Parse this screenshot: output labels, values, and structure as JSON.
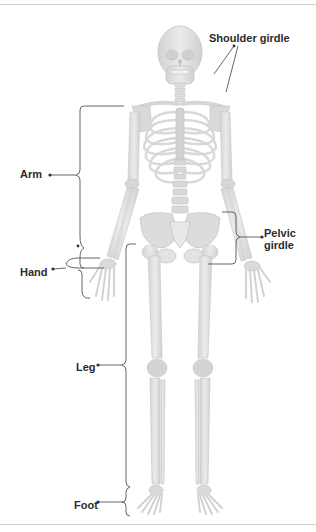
{
  "figure": {
    "top_caption_cut": "...pp...",
    "bottom_caption_cut": "..."
  },
  "labels": {
    "shoulder_girdle": "Shoulder girdle",
    "arm": "Arm",
    "hand": "Hand",
    "pelvic_girdle_line1": "Pelvic",
    "pelvic_girdle_line2": "girdle",
    "leg": "Leg",
    "foot": "Foot"
  },
  "colors": {
    "bone": "#e2e2e2",
    "bone_shade": "#cfcfcf",
    "bone_outline": "#bdbdbd",
    "leader_line": "#555555",
    "label_text": "#2b2b2b",
    "background": "#ffffff"
  }
}
